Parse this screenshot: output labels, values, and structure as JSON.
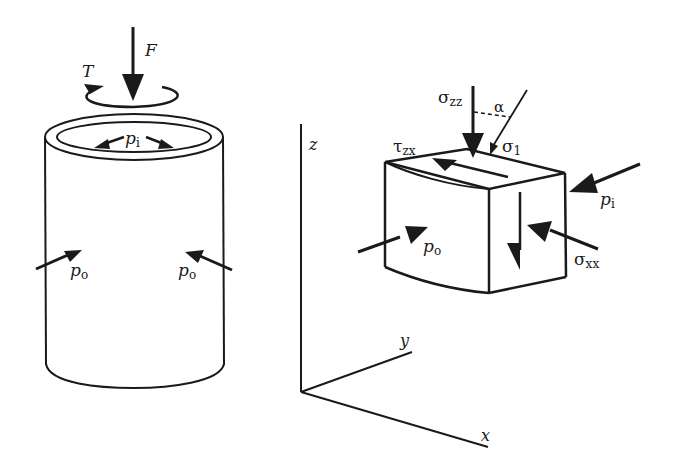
{
  "figure": {
    "left_panel": {
      "name": "hollow-cylinder",
      "labels": {
        "axial_force": "F",
        "torque": "T",
        "internal_pressure": "p",
        "internal_pressure_sub": "i",
        "external_pressure_left": "p",
        "external_pressure_left_sub": "o",
        "external_pressure_right": "p",
        "external_pressure_right_sub": "o"
      }
    },
    "right_panel": {
      "name": "stress-element",
      "labels": {
        "sigma_zz": "σ",
        "sigma_zz_sub": "zz",
        "alpha": "α",
        "sigma_1": "σ",
        "sigma_1_sub": "1",
        "tau_zx": "τ",
        "tau_zx_sub": "zx",
        "p_i": "p",
        "p_i_sub": "i",
        "p_o": "p",
        "p_o_sub": "o",
        "sigma_xx": "σ",
        "sigma_xx_sub": "xx"
      },
      "axes": {
        "z": "z",
        "y": "y",
        "x": "x"
      }
    },
    "colors": {
      "ink": "#1a1a1a",
      "background": "#ffffff"
    }
  }
}
